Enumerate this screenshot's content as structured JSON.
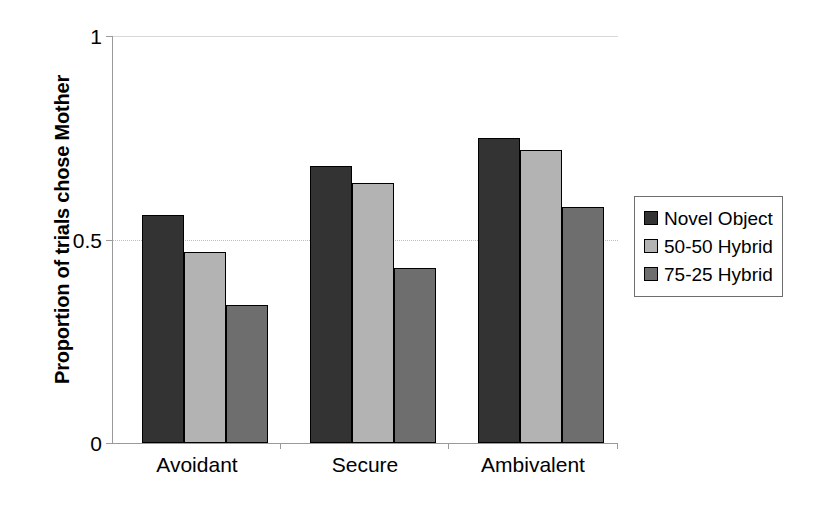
{
  "chart_data": {
    "type": "bar",
    "title": "",
    "subtitle": "",
    "xlabel": "",
    "ylabel": "Proportion of trials chose Mother",
    "categories": [
      "Avoidant",
      "Secure",
      "Ambivalent"
    ],
    "series": [
      {
        "name": "Novel Object",
        "values": [
          0.56,
          0.68,
          0.75
        ],
        "color": "#333333"
      },
      {
        "name": "50-50 Hybrid",
        "values": [
          0.47,
          0.64,
          0.72
        ],
        "color": "#b3b3b3"
      },
      {
        "name": "75-25 Hybrid",
        "values": [
          0.34,
          0.43,
          0.58
        ],
        "color": "#6e6e6e"
      }
    ],
    "ylim": [
      0,
      1
    ],
    "yticks": [
      "0",
      "0.5",
      "1"
    ],
    "ytick_values": [
      0,
      0.5,
      1
    ],
    "grid": true,
    "grid_axis": "y",
    "legend_position": "right",
    "bar_border_color": "#000000",
    "plot_background": "#ffffff"
  },
  "axes": {
    "y_title": "Proportion of trials chose Mother",
    "y_tick_labels": {
      "top": "1",
      "mid": "0.5",
      "bottom": "0"
    }
  },
  "x_axis": {
    "labels": [
      "Avoidant",
      "Secure",
      "Ambivalent"
    ]
  },
  "legend": {
    "items": [
      {
        "label": "Novel Object"
      },
      {
        "label": "50-50 Hybrid"
      },
      {
        "label": "75-25 Hybrid"
      }
    ]
  }
}
